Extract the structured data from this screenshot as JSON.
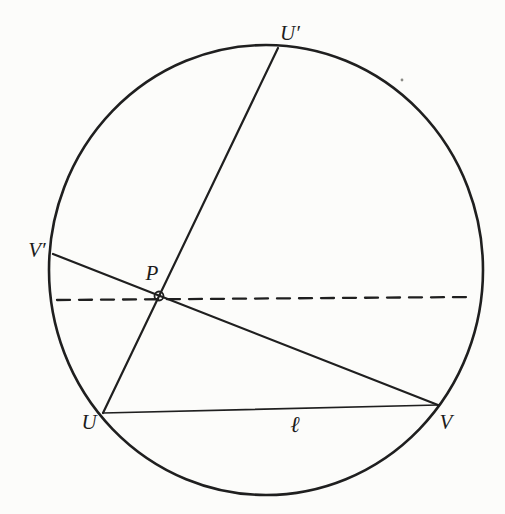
{
  "diagram": {
    "labels": {
      "u_prime": "U′",
      "v_prime": "V′",
      "p": "P",
      "u": "U",
      "v": "V",
      "ell": "ℓ"
    },
    "colors": {
      "stroke": "#1f1f1f",
      "background": "#fcfcfa",
      "point_fill": "#ffffff"
    }
  }
}
